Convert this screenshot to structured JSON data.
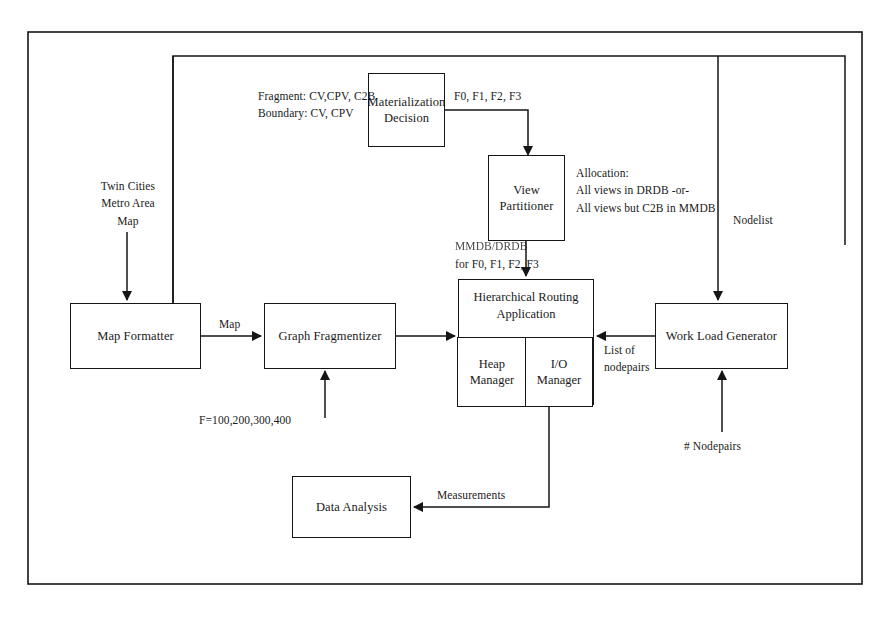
{
  "diagram": {
    "frame": {
      "stroke": "#151515"
    },
    "nodes": {
      "map_formatter": "Map Formatter",
      "graph_fragmentizer": "Graph Fragmentizer",
      "materialization_decision": "Materialization\nDecision",
      "view_partitioner": "View Partitioner",
      "hierarchical_routing_application": "Hierarchical Routing\nApplication",
      "heap_manager": "Heap\nManager",
      "io_manager": "I/O\nManager",
      "work_load_generator": "Work Load Generator",
      "data_analysis": "Data Analysis"
    },
    "labels": {
      "twin_cities_map": "Twin Cities\nMetro Area\nMap",
      "fragment_boundary": "Fragment: CV,CPV, C2B\nBoundary: CV, CPV",
      "fragments_out": "F0, F1, F2, F3",
      "allocation": "Allocation:\nAll views in DRDB -or-\nAll views but C2B in MMDB",
      "storage_assignment_top": "MMDB/DRDB",
      "storage_assignment_bottom": "for F0, F1, F2, F3",
      "map": "Map",
      "fragment_sizes": "F=100,200,300,400",
      "nodelist": "Nodelist",
      "list_of_nodepairs": "List of\nnodepairs",
      "num_nodepairs": "# Nodepairs",
      "measurements": "Measurements"
    }
  }
}
